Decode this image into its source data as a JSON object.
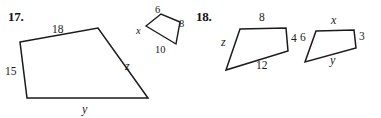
{
  "page": {
    "width": 381,
    "height": 118,
    "background": "#ffffff",
    "ink_color": "#1a1a1a"
  },
  "problems": [
    {
      "number": "17.",
      "name": "problem-17",
      "figures": [
        {
          "name": "large-quadrilateral",
          "role": "first-quadrilateral",
          "vertices": [
            [
              20,
              42
            ],
            [
              98,
              28
            ],
            [
              148,
              98
            ],
            [
              27,
              98
            ]
          ],
          "labels": [
            {
              "text": "18",
              "kind": "num",
              "x": 52,
              "y": 24
            },
            {
              "text": "z",
              "kind": "var",
              "x": 125,
              "y": 60
            },
            {
              "text": "y",
              "kind": "var",
              "x": 82,
              "y": 103
            },
            {
              "text": "15",
              "kind": "num",
              "x": 5,
              "y": 66
            }
          ]
        },
        {
          "name": "small-quadrilateral",
          "role": "second-quadrilateral",
          "vertices": [
            [
              146,
              26
            ],
            [
              161,
              14
            ],
            [
              180,
              22
            ],
            [
              176,
              44
            ]
          ],
          "labels": [
            {
              "text": "6",
              "kind": "num",
              "x": 155,
              "y": 5
            },
            {
              "text": "8",
              "kind": "num",
              "x": 179,
              "y": 19
            },
            {
              "text": "10",
              "kind": "num",
              "x": 155,
              "y": 45
            },
            {
              "text": "x",
              "kind": "var",
              "x": 136,
              "y": 26
            }
          ]
        }
      ]
    },
    {
      "number": "18.",
      "name": "problem-18",
      "figures": [
        {
          "name": "left-quadrilateral",
          "role": "first-quadrilateral",
          "vertices": [
            [
              240,
              29
            ],
            [
              286,
              28
            ],
            [
              288,
              51
            ],
            [
              226,
              70
            ]
          ],
          "labels": [
            {
              "text": "8",
              "kind": "num",
              "x": 259,
              "y": 12
            },
            {
              "text": "4",
              "kind": "num",
              "x": 291,
              "y": 33
            },
            {
              "text": "12",
              "kind": "num",
              "x": 256,
              "y": 60
            },
            {
              "text": "z",
              "kind": "var",
              "x": 221,
              "y": 36
            }
          ]
        },
        {
          "name": "right-quadrilateral",
          "role": "second-quadrilateral",
          "vertices": [
            [
              316,
              31
            ],
            [
              354,
              30
            ],
            [
              356,
              48
            ],
            [
              305,
              62
            ]
          ],
          "labels": [
            {
              "text": "x",
              "kind": "var",
              "x": 331,
              "y": 14
            },
            {
              "text": "3",
              "kind": "num",
              "x": 359,
              "y": 31
            },
            {
              "text": "y",
              "kind": "var",
              "x": 330,
              "y": 54
            },
            {
              "text": "6",
              "kind": "num",
              "x": 300,
              "y": 32
            }
          ]
        }
      ]
    }
  ],
  "prob_number_positions": [
    {
      "x": 8,
      "y": 9
    },
    {
      "x": 196,
      "y": 9
    }
  ]
}
